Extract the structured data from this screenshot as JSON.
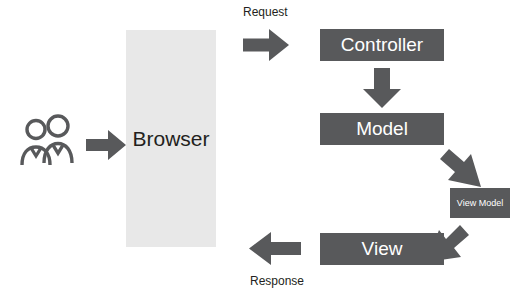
{
  "diagram": {
    "colors": {
      "dark_box": "#58595b",
      "light_box": "#e8e8e8",
      "arrow": "#58595b",
      "text_dark": "#231f20",
      "text_light": "#ffffff",
      "background": "#ffffff"
    },
    "nodes": {
      "actors": {
        "icon": "users-icon",
        "label": ""
      },
      "browser": {
        "label": "Browser"
      },
      "controller": {
        "label": "Controller"
      },
      "model": {
        "label": "Model"
      },
      "view_model": {
        "label": "View Model"
      },
      "view": {
        "label": "View"
      }
    },
    "labels": {
      "request": "Request",
      "response": "Response"
    },
    "arrows": [
      {
        "name": "users-to-browser",
        "direction": "right"
      },
      {
        "name": "browser-to-controller",
        "direction": "right",
        "label": "Request"
      },
      {
        "name": "controller-to-model",
        "direction": "down"
      },
      {
        "name": "model-to-view-model",
        "direction": "down-right"
      },
      {
        "name": "view-model-to-view",
        "direction": "down-left"
      },
      {
        "name": "view-to-browser",
        "direction": "left",
        "label": "Response"
      }
    ]
  }
}
